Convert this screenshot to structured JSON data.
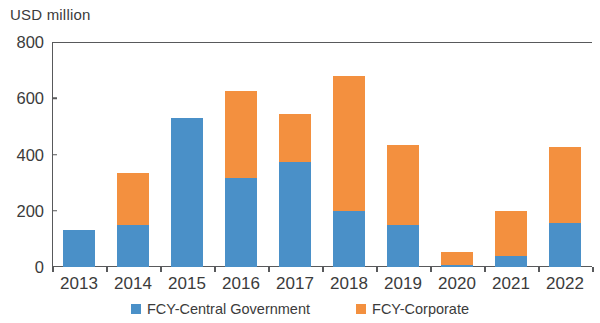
{
  "chart_data": {
    "type": "bar",
    "stacked": true,
    "title": "",
    "subtitle": "",
    "xlabel": "",
    "ylabel": "USD million",
    "ylim": [
      0,
      800
    ],
    "yticks": [
      0,
      200,
      400,
      600,
      800
    ],
    "ytick_labels": [
      "0",
      "200",
      "400",
      "600",
      "800"
    ],
    "grid": false,
    "legend_position": "bottom",
    "categories": [
      "2013",
      "2014",
      "2015",
      "2016",
      "2017",
      "2018",
      "2019",
      "2020",
      "2021",
      "2022"
    ],
    "series": [
      {
        "name": "FCY-Central Government",
        "color": "#4a90c8",
        "values": [
          130,
          150,
          530,
          315,
          375,
          200,
          150,
          8,
          40,
          155
        ]
      },
      {
        "name": "FCY-Corporate",
        "color": "#f3903f",
        "values": [
          0,
          185,
          0,
          310,
          170,
          480,
          285,
          47,
          160,
          270
        ]
      }
    ],
    "totals": [
      130,
      335,
      530,
      625,
      545,
      680,
      435,
      55,
      200,
      425
    ],
    "axis_color": "#58595b",
    "text_color": "#3b3b3b",
    "background": "#ffffff"
  }
}
